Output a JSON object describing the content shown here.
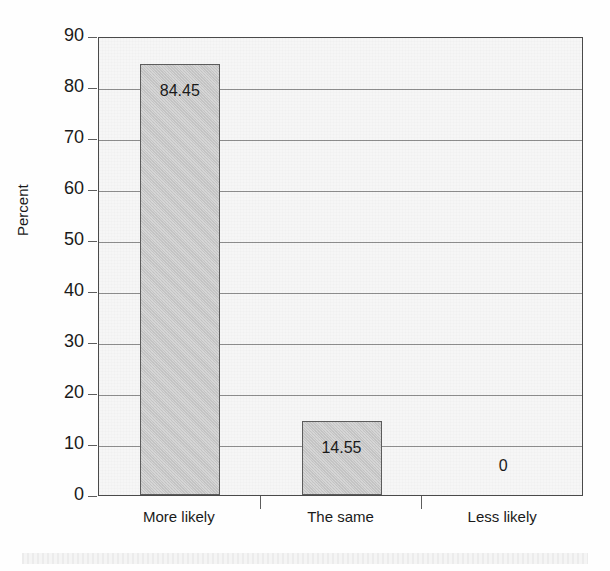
{
  "chart_data": {
    "type": "bar",
    "title": "",
    "subtitle": "",
    "xlabel": "",
    "ylabel": "Percent",
    "categories": [
      "More likely",
      "The same",
      "Less likely"
    ],
    "values": [
      84.45,
      14.55,
      0
    ],
    "data_labels": [
      "84.45",
      "14.55",
      "0"
    ],
    "ylim": [
      0,
      90
    ],
    "yticks": [
      0,
      10,
      20,
      30,
      40,
      50,
      60,
      70,
      80,
      90
    ],
    "ytick_labels": [
      "0",
      "10",
      "20",
      "30",
      "40",
      "50",
      "60",
      "70",
      "80",
      "90"
    ],
    "grid": true,
    "legend": null,
    "series": [
      {
        "name": "Percent",
        "values": [
          84.45,
          14.55,
          0
        ]
      }
    ],
    "colors": {
      "bar_fill": "#c9c9c9",
      "bar_border": "#5d5d5d",
      "plot_background": "#f6f6f6",
      "gridline": "#8e8e8e",
      "axis": "#4a4a4a",
      "text": "#1a1a1a"
    }
  }
}
